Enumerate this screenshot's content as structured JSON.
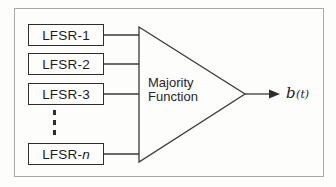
{
  "diagram": {
    "title_semantic": "Majority function keystream generator",
    "lfsr_boxes": [
      {
        "prefix": "LFSR-",
        "suffix": "1"
      },
      {
        "prefix": "LFSR-",
        "suffix": "2"
      },
      {
        "prefix": "LFSR-",
        "suffix": "3"
      },
      {
        "prefix": "LFSR-",
        "suffix": "n"
      }
    ],
    "majority": {
      "lines": [
        "Majority",
        "Function"
      ]
    },
    "output": {
      "variable": "b",
      "args": "(t)"
    },
    "colors": {
      "line": "#3a3a3a",
      "box_border": "#2e2e2e",
      "frame_border": "#a8a8a6",
      "text": "#1c1c1c",
      "background": "#fdfdfc"
    }
  }
}
